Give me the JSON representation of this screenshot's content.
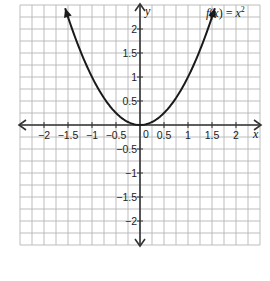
{
  "chart_data": {
    "type": "line",
    "title": "",
    "function_label": "f(x) = x²",
    "function_label_parts": {
      "f": "f",
      "open": "(",
      "x": "x",
      "close": ") = ",
      "base": "x",
      "exp": "2"
    },
    "xlabel": "x",
    "ylabel": "y",
    "xlim": [
      -2.5,
      2.5
    ],
    "ylim": [
      -2.5,
      2.5
    ],
    "grid": true,
    "grid_step": 0.25,
    "x_ticks": [
      {
        "value": -2,
        "label": "−2"
      },
      {
        "value": -1.5,
        "label": "−1.5"
      },
      {
        "value": -1,
        "label": "−1"
      },
      {
        "value": -0.5,
        "label": "−0.5"
      },
      {
        "value": 0.5,
        "label": "0.5"
      },
      {
        "value": 1,
        "label": "1"
      },
      {
        "value": 1.5,
        "label": "1.5"
      },
      {
        "value": 2,
        "label": "2"
      }
    ],
    "y_ticks": [
      {
        "value": 2,
        "label": "2"
      },
      {
        "value": 1.5,
        "label": "1.5"
      },
      {
        "value": 1,
        "label": "1"
      },
      {
        "value": 0.5,
        "label": "0.5"
      },
      {
        "value": -0.5,
        "label": "−0.5"
      },
      {
        "value": -1,
        "label": "−1"
      },
      {
        "value": -1.5,
        "label": "−1.5"
      },
      {
        "value": -2,
        "label": "−2"
      }
    ],
    "origin_label": "0",
    "series": [
      {
        "name": "f(x) = x^2",
        "x": [
          -1.56,
          -1.5,
          -1.25,
          -1,
          -0.75,
          -0.5,
          -0.25,
          0,
          0.25,
          0.5,
          0.75,
          1,
          1.25,
          1.5,
          1.56
        ],
        "y": [
          2.43,
          2.25,
          1.5625,
          1,
          0.5625,
          0.25,
          0.0625,
          0,
          0.0625,
          0.25,
          0.5625,
          1,
          1.5625,
          2.25,
          2.43
        ]
      }
    ],
    "colors": {
      "grid": "#b5b5b5",
      "axis": "#333333",
      "curve": "#1a1a1a",
      "text": "#222222"
    }
  }
}
